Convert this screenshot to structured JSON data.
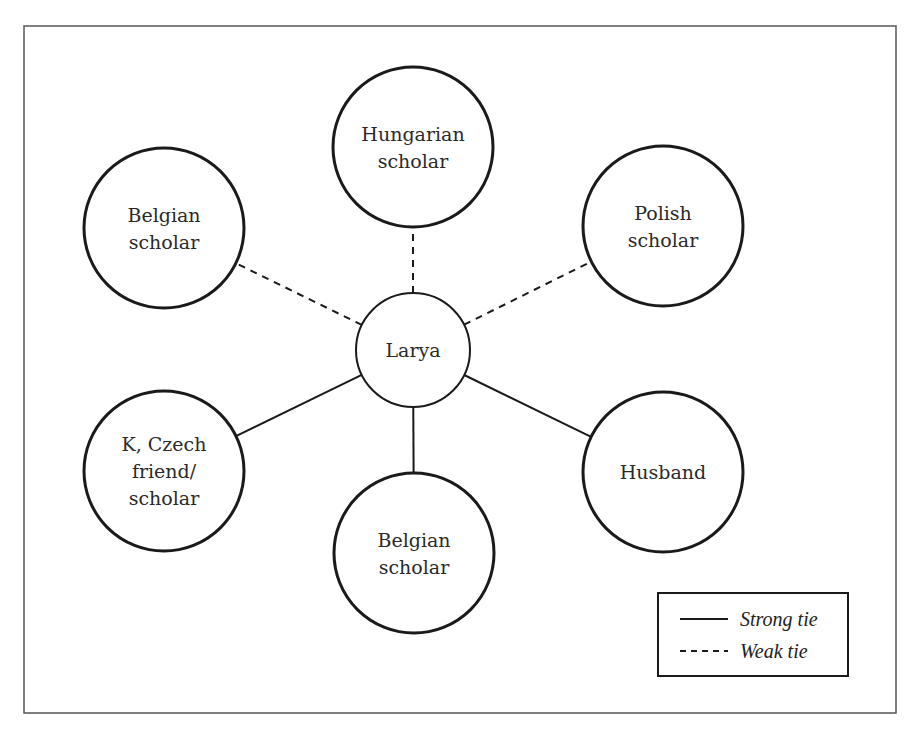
{
  "diagram": {
    "type": "ego-network",
    "center": {
      "id": "larya",
      "label": [
        "Larya"
      ],
      "cx": 413,
      "cy": 350,
      "r": 57
    },
    "nodes": [
      {
        "id": "hungarian-scholar",
        "label": [
          "Hungarian",
          "scholar"
        ],
        "cx": 413,
        "cy": 147,
        "r": 80,
        "tie": "weak"
      },
      {
        "id": "belgian-scholar-top",
        "label": [
          "Belgian",
          "scholar"
        ],
        "cx": 164,
        "cy": 228,
        "r": 80,
        "tie": "weak"
      },
      {
        "id": "polish-scholar",
        "label": [
          "Polish",
          "scholar"
        ],
        "cx": 663,
        "cy": 226,
        "r": 80,
        "tie": "weak"
      },
      {
        "id": "k-czech-friend-scholar",
        "label": [
          "K, Czech",
          "friend/",
          "scholar"
        ],
        "cx": 164,
        "cy": 471,
        "r": 80,
        "tie": "strong"
      },
      {
        "id": "belgian-scholar-bottom",
        "label": [
          "Belgian",
          "scholar"
        ],
        "cx": 414,
        "cy": 553,
        "r": 80,
        "tie": "strong"
      },
      {
        "id": "husband",
        "label": [
          "Husband"
        ],
        "cx": 663,
        "cy": 472,
        "r": 80,
        "tie": "strong"
      }
    ],
    "legend": {
      "items": [
        {
          "style": "solid",
          "label": "Strong tie"
        },
        {
          "style": "dashed",
          "label": "Weak tie"
        }
      ]
    },
    "colors": {
      "stroke": "#1a1a1a",
      "frame": "#555555",
      "text": "#2a2a2a",
      "background": "#ffffff"
    }
  }
}
